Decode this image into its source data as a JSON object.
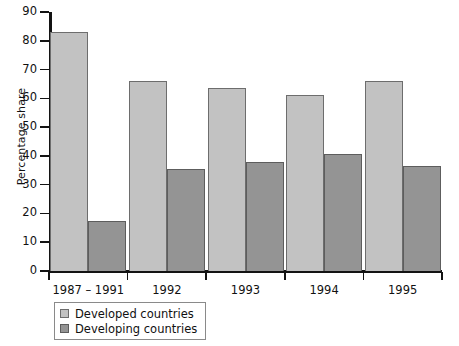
{
  "chart_data": {
    "type": "bar",
    "title": "",
    "xlabel": "",
    "ylabel": "Percentage share",
    "ylim": [
      0,
      90
    ],
    "yticks": [
      0,
      10,
      20,
      30,
      40,
      50,
      60,
      70,
      80,
      90
    ],
    "grid": false,
    "legend_position": "below-left",
    "categories": [
      "1987 – 1991",
      "1992",
      "1993",
      "1994",
      "1995"
    ],
    "series": [
      {
        "name": "Developed countries",
        "color": "#c2c2c2",
        "values": [
          83,
          66,
          63.5,
          61,
          66
        ]
      },
      {
        "name": "Developing countries",
        "color": "#949494",
        "values": [
          17.5,
          35.5,
          38,
          40.5,
          36.5
        ]
      }
    ]
  },
  "axis": {
    "y_title": "Percentage share"
  },
  "legend": {
    "items": [
      {
        "label": "Developed countries"
      },
      {
        "label": "Developing countries"
      }
    ]
  }
}
